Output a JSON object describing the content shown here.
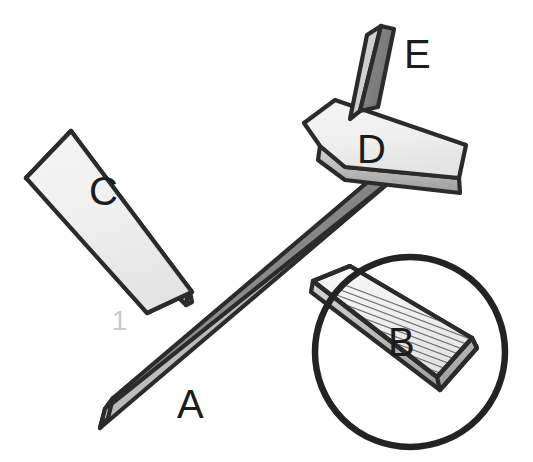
{
  "diagram": {
    "kind": "technical-line-illustration",
    "canvas": {
      "width": 533,
      "height": 462,
      "background": "#ffffff"
    },
    "colors": {
      "outline": "#2b2b2b",
      "face_light": "#f1f1f1",
      "face_light_2": "#e9e9e9",
      "face_dark": "#868686",
      "edge_mid": "#a8a8a8",
      "edge_shadow": "#747474",
      "hatch": "#6f6f6f",
      "circle_stroke": "#232323",
      "label_color": "#1c1c1c",
      "faint_label_color": "#c9c9c9"
    },
    "labels": [
      {
        "id": "label-a",
        "text": "A",
        "x": 177,
        "y": 418,
        "size": 40,
        "color": "#1c1c1c",
        "part": "long-diagonal-beam"
      },
      {
        "id": "label-b",
        "text": "B",
        "x": 388,
        "y": 356,
        "size": 40,
        "color": "#1c1c1c",
        "part": "hatched-plate"
      },
      {
        "id": "label-c",
        "text": "C",
        "x": 89,
        "y": 205,
        "size": 40,
        "color": "#1c1c1c",
        "part": "upper-left-plate"
      },
      {
        "id": "label-d",
        "text": "D",
        "x": 357,
        "y": 163,
        "size": 40,
        "color": "#1c1c1c",
        "part": "chevron-plate"
      },
      {
        "id": "label-e",
        "text": "E",
        "x": 404,
        "y": 68,
        "size": 40,
        "color": "#1c1c1c",
        "part": "dark-upright-fin"
      },
      {
        "id": "label-1",
        "text": "1",
        "x": 112,
        "y": 330,
        "size": 27,
        "color": "#c9c9c9",
        "part": "assembly-callout"
      }
    ],
    "detail_circle": {
      "id": "detail-circle-b",
      "center_x": 410,
      "center_y": 352,
      "radius": 95,
      "stroke": "#232323",
      "stroke_width": 6.5,
      "encloses": "B"
    },
    "parts": [
      {
        "id": "part-a",
        "label": "A",
        "name": "long-diagonal-beam",
        "description": "Long slender beam running lower-left to upper-right, medium-gray top face with lighter narrow side face"
      },
      {
        "id": "part-b",
        "label": "B",
        "name": "hatched-plate",
        "description": "Flat plate at lower right, partly covered by detail circle showing fine hatching lines"
      },
      {
        "id": "part-c",
        "label": "C",
        "name": "upper-left-plate",
        "description": "Light rectangular slab rotated, upper-left of the scene"
      },
      {
        "id": "part-d",
        "label": "D",
        "name": "chevron-plate",
        "description": "Arrow / chevron shaped light plate at upper right straddling beam A"
      },
      {
        "id": "part-e",
        "label": "E",
        "name": "dark-upright-fin",
        "description": "Dark gray upright parallelogram fin rising from plate D"
      }
    ],
    "hatching": {
      "line_count": 11,
      "color": "#6f6f6f",
      "orientation": "parallel-to-plate-long-axis",
      "applies_to": "B"
    }
  }
}
